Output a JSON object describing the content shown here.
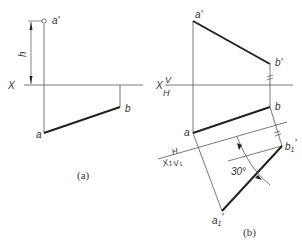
{
  "figure_a": {
    "caption": "(a)",
    "axis_label": "X",
    "height_label": "h",
    "points": {
      "a_prime": "a'",
      "a": "a",
      "b": "b"
    }
  },
  "figure_b": {
    "caption": "(b)",
    "axis_label": "X",
    "axis_upper": "V",
    "axis_lower": "H",
    "axis1_label": "X",
    "axis1_sub": "1",
    "axis1_upper": "H",
    "axis1_lower": "V",
    "axis1_lower_sub": "1",
    "angle_label": "30°",
    "points": {
      "a_prime": "a'",
      "b_prime": "b'",
      "a": "a",
      "b": "b",
      "a1_prime": "a",
      "b1_prime": "b"
    },
    "sub1": "1",
    "prime": "'"
  },
  "colors": {
    "line": "#555555",
    "bold": "#222222",
    "text": "#333333"
  }
}
